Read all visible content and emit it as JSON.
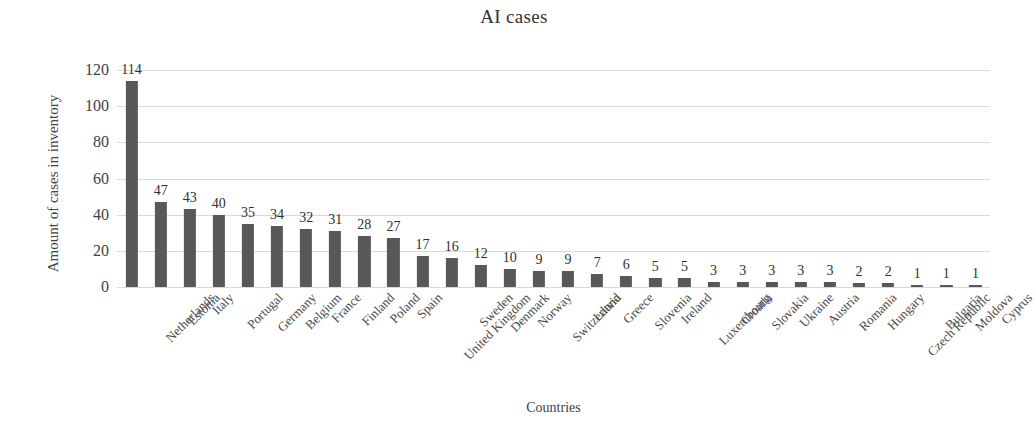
{
  "chart_data": {
    "type": "bar",
    "title": "AI cases",
    "xlabel": "Countries",
    "ylabel": "Amount of cases in inventory",
    "ylim": [
      0,
      120
    ],
    "yticks": [
      0,
      20,
      40,
      60,
      80,
      100,
      120
    ],
    "grid": true,
    "legend": "none",
    "bar_color": "#58585a",
    "gridline_color": "#d9d9d9",
    "categories": [
      "Netherlands",
      "Estonia",
      "Italy",
      "Portugal",
      "Germany",
      "Belgium",
      "France",
      "Finland",
      "Poland",
      "Spain",
      "United Kingdom",
      "Sweden",
      "Denmark",
      "Norway",
      "Switzerland",
      "Latvia",
      "Greece",
      "Slovenia",
      "Ireland",
      "Luxembourg",
      "Croatia",
      "Slovakia",
      "Ukraine",
      "Austria",
      "Romania",
      "Hungary",
      "Czech Republic",
      "Bulgaria",
      "Moldova",
      "Cyprus"
    ],
    "values": [
      114,
      47,
      43,
      40,
      35,
      34,
      32,
      31,
      28,
      27,
      17,
      16,
      12,
      10,
      9,
      9,
      7,
      6,
      5,
      5,
      3,
      3,
      3,
      3,
      3,
      2,
      2,
      1,
      1,
      1
    ]
  }
}
